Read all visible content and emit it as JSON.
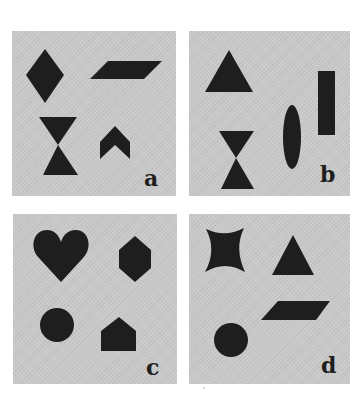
{
  "figure": {
    "background": "#ffffff",
    "panel_color": "#c9c9c9",
    "shape_color": "#1e1e1e",
    "panels": [
      {
        "id": "a",
        "label": "a",
        "shapes": [
          "diamond",
          "parallelogram",
          "hourglass",
          "chevron"
        ]
      },
      {
        "id": "b",
        "label": "b",
        "shapes": [
          "triangle",
          "rectangle",
          "ellipse",
          "hourglass"
        ]
      },
      {
        "id": "c",
        "label": "c",
        "shapes": [
          "heart",
          "hexagon",
          "circle",
          "pentagon-house"
        ]
      },
      {
        "id": "d",
        "label": "d",
        "shapes": [
          "concave-star",
          "triangle",
          "parallelogram",
          "circle"
        ]
      }
    ]
  }
}
